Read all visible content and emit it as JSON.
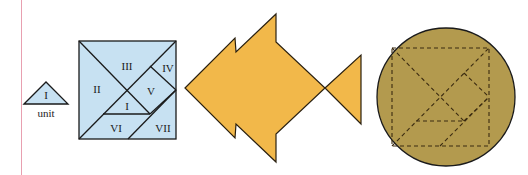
{
  "unit_piece": {
    "label": "I",
    "caption": "unit"
  },
  "tangram_square": {
    "pieces": [
      {
        "id": "II",
        "label": "II"
      },
      {
        "id": "III",
        "label": "III"
      },
      {
        "id": "IV",
        "label": "IV"
      },
      {
        "id": "V",
        "label": "V"
      },
      {
        "id": "I",
        "label": "I"
      },
      {
        "id": "VI",
        "label": "VI"
      },
      {
        "id": "VII",
        "label": "VII"
      }
    ],
    "fill": "#c7e1f2"
  },
  "fish": {
    "fill": "#f2b84a"
  },
  "circle": {
    "fill": "#b39a4e"
  },
  "colors": {
    "margin_line": "#e8a0b0",
    "stroke": "#1a1a1a"
  }
}
